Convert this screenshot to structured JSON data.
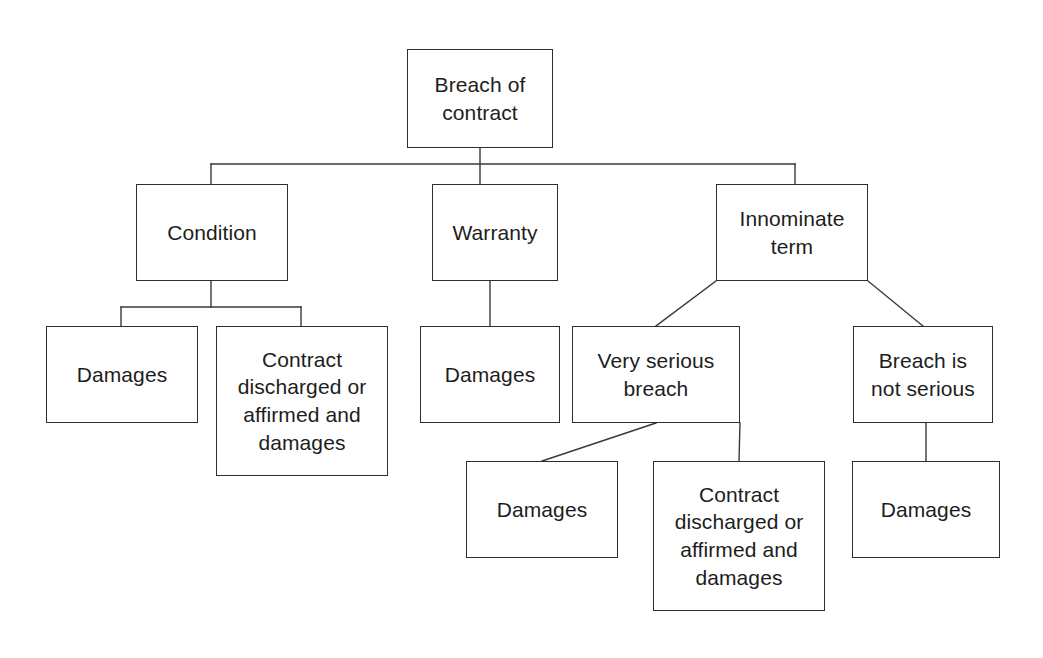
{
  "diagram": {
    "title": "Breach of contract",
    "type": "tree-diagram",
    "background_color": "#ffffff",
    "box_border_color": "#2e2e2e",
    "edge_color": "#3a3a3a",
    "text_color": "#1d1d1d",
    "nodes": [
      {
        "id": "root",
        "label": "Breach of\ncontract",
        "x": 407,
        "y": 49,
        "w": 146,
        "h": 99,
        "font_size": 21
      },
      {
        "id": "condition",
        "label": "Condition",
        "x": 136,
        "y": 184,
        "w": 152,
        "h": 97,
        "font_size": 21
      },
      {
        "id": "warranty",
        "label": "Warranty",
        "x": 432,
        "y": 184,
        "w": 126,
        "h": 97,
        "font_size": 21
      },
      {
        "id": "innominate-term",
        "label": "Innominate\nterm",
        "x": 716,
        "y": 184,
        "w": 152,
        "h": 97,
        "font_size": 21
      },
      {
        "id": "condition-damages",
        "label": "Damages",
        "x": 46,
        "y": 326,
        "w": 152,
        "h": 97,
        "font_size": 21
      },
      {
        "id": "condition-contract-discharged",
        "label": "Contract\ndischarged or\naffirmed and\ndamages",
        "x": 216,
        "y": 326,
        "w": 172,
        "h": 150,
        "font_size": 21
      },
      {
        "id": "warranty-damages",
        "label": "Damages",
        "x": 420,
        "y": 326,
        "w": 140,
        "h": 97,
        "font_size": 21
      },
      {
        "id": "very-serious-breach",
        "label": "Very serious\nbreach",
        "x": 572,
        "y": 326,
        "w": 168,
        "h": 97,
        "font_size": 21
      },
      {
        "id": "breach-not-serious",
        "label": "Breach is\nnot serious",
        "x": 853,
        "y": 326,
        "w": 140,
        "h": 97,
        "font_size": 21
      },
      {
        "id": "very-serious-damages",
        "label": "Damages",
        "x": 466,
        "y": 461,
        "w": 152,
        "h": 97,
        "font_size": 21
      },
      {
        "id": "very-serious-contract-discharged",
        "label": "Contract\ndischarged or\naffirmed and\ndamages",
        "x": 653,
        "y": 461,
        "w": 172,
        "h": 150,
        "font_size": 21
      },
      {
        "id": "breach-not-serious-damages",
        "label": "Damages",
        "x": 852,
        "y": 461,
        "w": 148,
        "h": 97,
        "font_size": 21
      }
    ],
    "edges": [
      {
        "id": "root-stem",
        "from": "root",
        "to": "bus",
        "points": "480,148 480,164"
      },
      {
        "id": "bus-bar",
        "from": "root",
        "to": "level-2",
        "points": "211,164 795,164"
      },
      {
        "id": "bus-to-condition",
        "from": "root",
        "to": "condition",
        "points": "211,164 211,184"
      },
      {
        "id": "bus-to-warranty",
        "from": "root",
        "to": "warranty",
        "points": "480,164 480,184"
      },
      {
        "id": "bus-to-innominate",
        "from": "root",
        "to": "innominate-term",
        "points": "795,164 795,184"
      },
      {
        "id": "condition-stem",
        "from": "condition",
        "to": "condition-bus",
        "points": "211,281 211,307"
      },
      {
        "id": "condition-bus-bar",
        "from": "condition",
        "to": "condition-children",
        "points": "121,307 301,307"
      },
      {
        "id": "condition-to-damages",
        "from": "condition",
        "to": "condition-damages",
        "points": "121,307 121,326"
      },
      {
        "id": "condition-to-contract",
        "from": "condition",
        "to": "condition-contract-discharged",
        "points": "301,307 301,326"
      },
      {
        "id": "warranty-to-damages",
        "from": "warranty",
        "to": "warranty-damages",
        "points": "490,281 490,326"
      },
      {
        "id": "innominate-to-very",
        "from": "innominate-term",
        "to": "very-serious-breach",
        "points": "716,281 656,326"
      },
      {
        "id": "innominate-to-breach",
        "from": "innominate-term",
        "to": "breach-not-serious",
        "points": "868,281 923,326"
      },
      {
        "id": "very-to-damages",
        "from": "very-serious-breach",
        "to": "very-serious-damages",
        "points": "656,423 542,461"
      },
      {
        "id": "very-to-contract",
        "from": "very-serious-breach",
        "to": "very-serious-contract-discharged",
        "points": "740,423 739,461"
      },
      {
        "id": "breach-to-damages",
        "from": "breach-not-serious",
        "to": "breach-not-serious-damages",
        "points": "926,423 926,461"
      }
    ]
  }
}
